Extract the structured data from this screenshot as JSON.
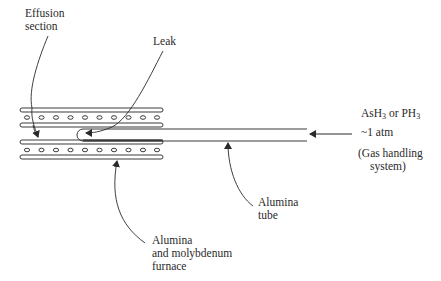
{
  "figure": {
    "type": "schematic",
    "colors": {
      "stroke": "#3a3a3a",
      "text": "#2a2a2a",
      "background": "#ffffff"
    }
  },
  "labels": {
    "effusion_section": {
      "line1": "Effusion",
      "line2": "section"
    },
    "leak": {
      "text": "Leak"
    },
    "gas_source": {
      "line1_prefix": "AsH",
      "line1_sub1": "3",
      "line1_mid": " or PH",
      "line1_sub2": "3",
      "line2": "~1 atm",
      "line3": "(Gas handling",
      "line4": "system)"
    },
    "alumina_tube": {
      "line1": "Alumina",
      "line2": "tube"
    },
    "furnace": {
      "line1": "Alumina",
      "line2": "and molybdenum",
      "line3": "furnace"
    }
  },
  "components": {
    "furnace_holes_per_row": 10,
    "furnace_rows": 2
  }
}
